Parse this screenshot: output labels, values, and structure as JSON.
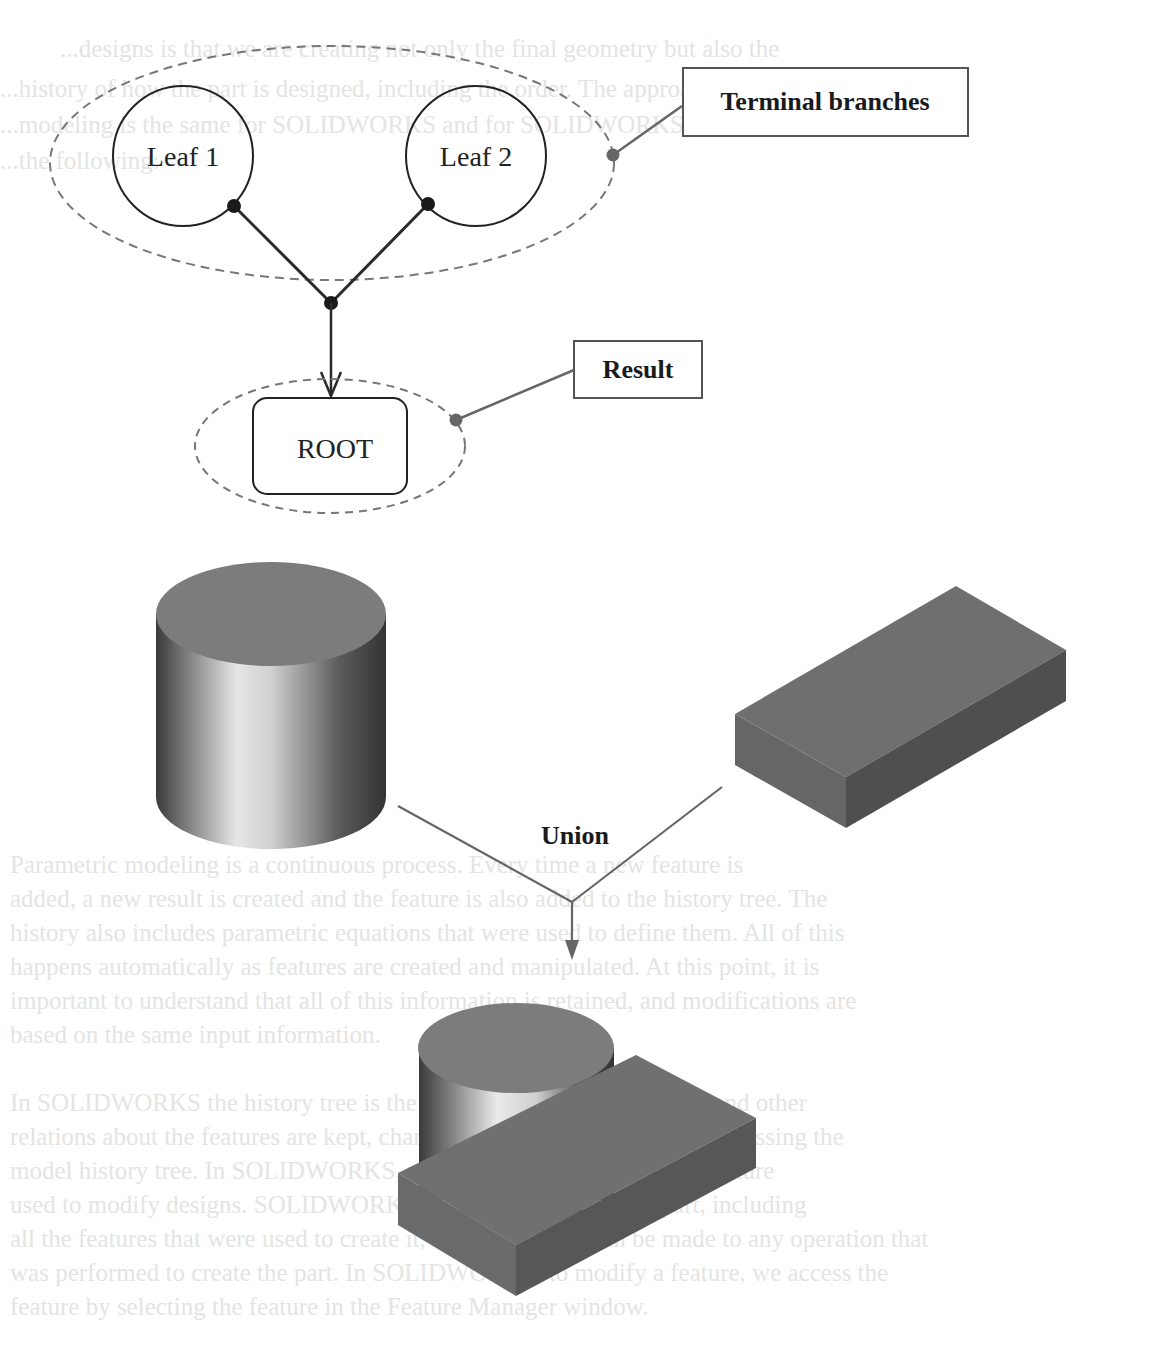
{
  "tree_diagram": {
    "leaf1_label": "Leaf 1",
    "leaf2_label": "Leaf 2",
    "root_label": "ROOT",
    "callout_terminal": "Terminal branches",
    "callout_result": "Result"
  },
  "boolean_diagram": {
    "operation_label": "Union",
    "input_shapes": [
      "cylinder",
      "box"
    ],
    "output_shape": "cylinder-union-box"
  },
  "colors": {
    "line_dark": "#2a2a2a",
    "line_gray": "#666666",
    "dashed": "#777777",
    "solid_face": "#7a7a7a",
    "solid_side": "#5f5f5f"
  },
  "ghost_text": {
    "lines": [
      "...designs is that we are creating not only the final geometry but also the",
      "...history of how the part is designed, including the order. The approach to",
      "...modeling is the same for SOLIDWORKS and for SOLIDWORKS, such as",
      "...the following:",
      "Parametric modeling is a continuous process. Every time a new feature is",
      "added, a new result is created and the feature is also added to the history tree. The",
      "history also includes parametric equations that were used to define them. All of this",
      "happens automatically as features are created and manipulated. At this point, it is",
      "important to understand that all of this information is retained, and modifications are",
      "based on the same input information.",
      "In SOLIDWORKS the history tree is the location that modeling order and other",
      "relations about the features are kept, changes can be accomplished by accessing the",
      "model history tree. In SOLIDWORKS, we can select and modify the feature",
      "used to modify designs. SOLIDWORKS records the history of a part, including",
      "all the features that were used to create it, so that changes can be made to any operation that",
      "was performed to create the part. In SOLIDWORKS, to modify a feature, we access the",
      "feature by selecting the feature in the Feature Manager window."
    ]
  }
}
